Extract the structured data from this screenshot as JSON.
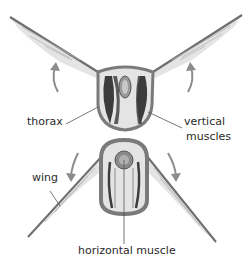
{
  "diagram": {
    "panels": [
      {
        "name": "upstroke",
        "wing_direction": "up"
      },
      {
        "name": "downstroke",
        "wing_direction": "down"
      }
    ],
    "labels": {
      "thorax": "thorax",
      "vertical_muscles_line1": "vertical",
      "vertical_muscles_line2": "muscles",
      "wing": "wing",
      "horizontal_muscle": "horizontal muscle"
    },
    "colors": {
      "thorax_outline": "#7a7a7a",
      "thorax_fill": "#e4e4e4",
      "muscle": "#3c3c3c",
      "wing": "#8a8a8a",
      "arrow": "#8c8c8c",
      "leader_line": "#555555",
      "text": "#2a2a2a"
    }
  }
}
